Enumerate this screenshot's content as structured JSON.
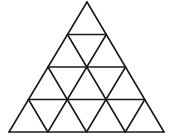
{
  "diagram": {
    "title": "Triangle subdivided into 16 small triangles",
    "type": "triangular-grid",
    "rows": 4,
    "small_triangle_count": 16,
    "stroke_color": "#1a1a1a",
    "background": "#ffffff",
    "apex": [
      87,
      2
    ],
    "bottom_left": [
      9,
      132
    ],
    "bottom_right": [
      164,
      132
    ]
  }
}
